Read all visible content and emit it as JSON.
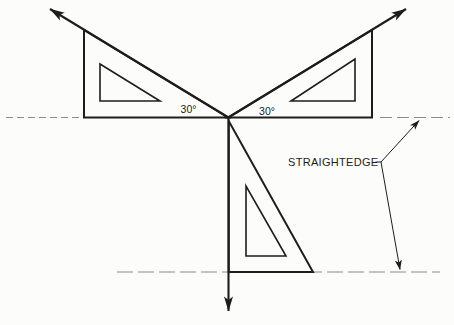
{
  "figure": {
    "description_labels": {
      "angle_left": "30°",
      "angle_right": "30°",
      "straightedge": "STRAIGHTEDGE"
    },
    "colors": {
      "line": "#1d1d1b",
      "dashed": "#8c8c8c",
      "background": "#fcfcfa"
    },
    "shapes": {
      "dash_top_left": "M6,117.5 L83,117.5",
      "dash_top_right": "M380,117.5 L450,117.5",
      "dash_bottom": "M117,272 L440,272",
      "left_triangle": "M84,30 L84,117.5 L228,117.5 Z",
      "left_triangle_cutout": "M100,64 L100,101 L160,101 Z",
      "right_triangle": "M372,30 L372,117.5 L228,117.5 Z",
      "right_triangle_cutout": "M355,59 L355,101 L291,101 Z",
      "bottom_triangle": "M228.75,121 L228.75,272 L313,272 Z",
      "bottom_triangle_cutout": "M246,186 L246,256 L286,256 Z",
      "ray_upper_left": "M228.5,117.5 L50,9",
      "ray_upper_right": "M228.5,117.5 L406,9",
      "ray_down": "M228.5,117.5 L228.5,311",
      "leader_upper": "M375.5,162 L381,162 L419,120.5",
      "leader_lower": "M381,162 L400,269.5"
    }
  }
}
